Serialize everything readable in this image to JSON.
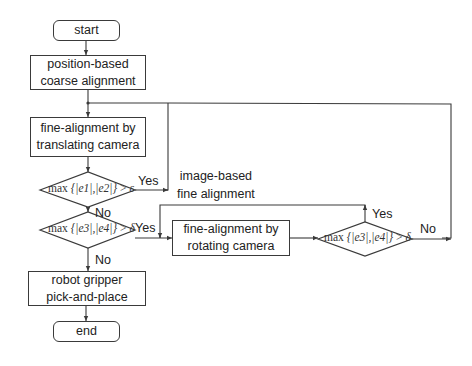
{
  "diagram": {
    "type": "flowchart",
    "nodes": {
      "start": {
        "label": "start",
        "shape": "terminal"
      },
      "coarse": {
        "line1": "position-based",
        "line2": "coarse alignment",
        "shape": "process"
      },
      "translate": {
        "line1": "fine-alignment by",
        "line2": "translating camera",
        "shape": "process"
      },
      "decision1": {
        "prefix": "max",
        "expr": "{|e1|,|e2|}",
        "op": ">",
        "threshold": "ε",
        "shape": "decision"
      },
      "decision2": {
        "prefix": "max",
        "expr": "{|e3|,|e4|}",
        "op": ">",
        "threshold": "δ",
        "shape": "decision"
      },
      "rotate": {
        "line1": "fine-alignment by",
        "line2": "rotating camera",
        "shape": "process"
      },
      "decision3": {
        "prefix": "max",
        "expr": "{|e3|,|e4|}",
        "op": ">",
        "threshold": "δ",
        "shape": "decision"
      },
      "gripper": {
        "line1": "robot gripper",
        "line2": "pick-and-place",
        "shape": "process"
      },
      "end": {
        "label": "end",
        "shape": "terminal"
      }
    },
    "annotations": {
      "image_based_line1": "image-based",
      "image_based_line2": "fine alignment"
    },
    "edge_labels": {
      "d1_yes": "Yes",
      "d1_no": "No",
      "d2_yes": "Yes",
      "d2_no": "No",
      "d3_yes": "Yes",
      "d3_no": "No"
    },
    "edges": [
      {
        "from": "start",
        "to": "coarse"
      },
      {
        "from": "coarse",
        "to": "translate"
      },
      {
        "from": "translate",
        "to": "decision1"
      },
      {
        "from": "decision1",
        "to": "translate",
        "label": "Yes"
      },
      {
        "from": "decision1",
        "to": "decision2",
        "label": "No"
      },
      {
        "from": "decision2",
        "to": "rotate",
        "label": "Yes"
      },
      {
        "from": "decision2",
        "to": "gripper",
        "label": "No"
      },
      {
        "from": "rotate",
        "to": "decision3"
      },
      {
        "from": "decision3",
        "to": "rotate",
        "label": "Yes"
      },
      {
        "from": "decision3",
        "to": "translate",
        "label": "No"
      },
      {
        "from": "gripper",
        "to": "end"
      }
    ],
    "colors": {
      "stroke": "#3a3a3a",
      "text": "#222222",
      "background": "#ffffff"
    }
  }
}
